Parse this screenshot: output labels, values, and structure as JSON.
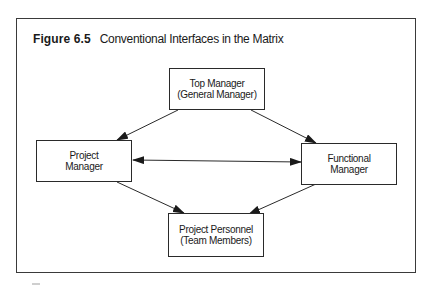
{
  "figure": {
    "number": "Figure 6.5",
    "caption": "Conventional Interfaces in the Matrix"
  },
  "nodes": {
    "top_manager": {
      "line1": "Top Manager",
      "line2": "(General Manager)"
    },
    "project_manager": {
      "line1": "Project",
      "line2": "Manager"
    },
    "functional_manager": {
      "line1": "Functional",
      "line2": "Manager"
    },
    "project_personnel": {
      "line1": "Project Personnel",
      "line2": "(Team Members)"
    }
  },
  "edges": [
    {
      "from": "Top Manager",
      "to": "Project Manager",
      "type": "directed"
    },
    {
      "from": "Top Manager",
      "to": "Functional Manager",
      "type": "directed"
    },
    {
      "from": "Project Manager",
      "to": "Functional Manager",
      "type": "bidirectional"
    },
    {
      "from": "Project Manager",
      "to": "Project Personnel",
      "type": "directed"
    },
    {
      "from": "Functional Manager",
      "to": "Project Personnel",
      "type": "directed"
    }
  ],
  "colors": {
    "line": "#2a2a2a",
    "background": "#ffffff"
  }
}
